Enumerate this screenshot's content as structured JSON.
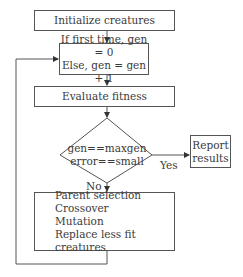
{
  "flowchart": {
    "nodes": {
      "init": {
        "label": "Initialize creatures"
      },
      "gen": {
        "lines": [
          "If first time, gen = 0",
          "Else, gen = gen + 1"
        ]
      },
      "evaluate": {
        "label": "Evaluate fitness"
      },
      "decision": {
        "lines": [
          "gen==maxgen",
          "error==small"
        ]
      },
      "report": {
        "lines": [
          "Report",
          "results"
        ]
      },
      "evolve": {
        "lines": [
          "Parent selection",
          "Crossover",
          "Mutation",
          "Replace less fit creatures"
        ]
      }
    },
    "edges": {
      "yes_label": "Yes",
      "no_label": "No"
    },
    "colors": {
      "line": "#555555",
      "text": "#3a3a3a",
      "background": "#ffffff"
    }
  }
}
